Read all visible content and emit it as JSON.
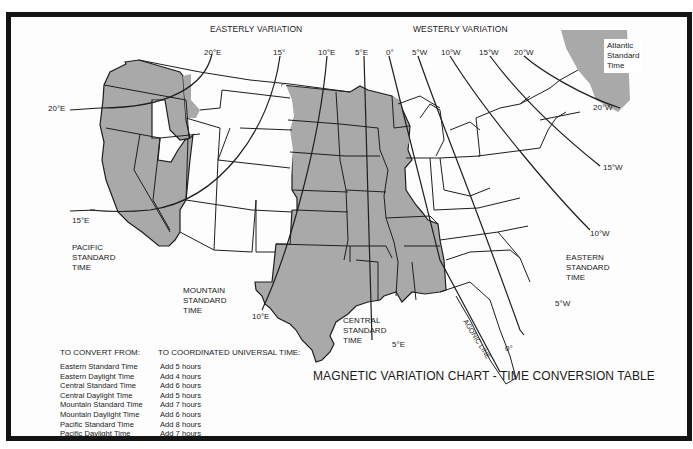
{
  "chart_title": "MAGNETIC VARIATION CHART - TIME CONVERSION TABLE",
  "headers": {
    "easterly": "EASTERLY VARIATION",
    "westerly": "WESTERLY VARIATION"
  },
  "isogonic_labels": {
    "top": [
      {
        "id": "e20",
        "text": "20°E"
      },
      {
        "id": "e15",
        "text": "15°"
      },
      {
        "id": "e10",
        "text": "10°E"
      },
      {
        "id": "e5",
        "text": "5°E"
      },
      {
        "id": "zero",
        "text": "0°"
      },
      {
        "id": "w5",
        "text": "5°W"
      },
      {
        "id": "w10",
        "text": "10°W"
      },
      {
        "id": "w15",
        "text": "15°W"
      },
      {
        "id": "w20",
        "text": "20°W"
      }
    ],
    "side": [
      {
        "id": "e20_left",
        "text": "20°E"
      },
      {
        "id": "e15_left",
        "text": "15°E"
      },
      {
        "id": "e10_bottom",
        "text": "10°E"
      },
      {
        "id": "e5_bottom",
        "text": "5°E"
      },
      {
        "id": "zero_bottom",
        "text": "0°"
      },
      {
        "id": "w5_right",
        "text": "5°W"
      },
      {
        "id": "w10_right",
        "text": "10°W"
      },
      {
        "id": "w15_right",
        "text": "15°W"
      },
      {
        "id": "w20_right",
        "text": "20°W"
      }
    ],
    "agonic": "AGONIC LINE"
  },
  "time_zones": {
    "pacific": [
      "PACIFIC",
      "STANDARD",
      "TIME"
    ],
    "mountain": [
      "MOUNTAIN",
      "STANDARD",
      "TIME"
    ],
    "central": [
      "CENTRAL",
      "STANDARD",
      "TIME"
    ],
    "eastern": [
      "EASTERN",
      "STANDARD",
      "TIME"
    ],
    "atlantic": [
      "Atlantic",
      "Standard",
      "Time"
    ]
  },
  "colors": {
    "shaded_zone": "#a9a9a9",
    "frame": "#141414",
    "lines": "#1e1e1e",
    "background": "#fdfdfd"
  },
  "conversion_table": {
    "from_header": "TO CONVERT FROM:",
    "to_header": "TO COORDINATED UNIVERSAL TIME:",
    "rows": [
      {
        "from": "Eastern Standard Time",
        "to": "Add 5 hours"
      },
      {
        "from": "Eastern Daylight Time",
        "to": "Add 4 hours"
      },
      {
        "from": "Central Standard Time",
        "to": "Add 6 hours"
      },
      {
        "from": "Central Daylight Time",
        "to": "Add 5 hours"
      },
      {
        "from": "Mountain Standard Time",
        "to": "Add 7 hours"
      },
      {
        "from": "Mountain Daylight Time",
        "to": "Add 6 hours"
      },
      {
        "from": "Pacific Standard Time",
        "to": "Add 8 hours"
      },
      {
        "from": "Pacific Daylight Time",
        "to": "Add 7 hours"
      }
    ]
  }
}
